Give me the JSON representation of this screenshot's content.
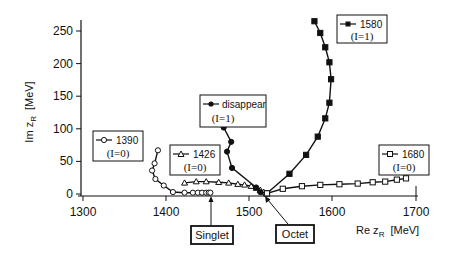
{
  "chart_data": {
    "type": "line",
    "title": "",
    "xlabel": "Re z_R [MeV]",
    "ylabel": "Im z_R [MeV]",
    "xlim": [
      1300,
      1700
    ],
    "ylim": [
      0,
      260
    ],
    "xticks": [
      1300,
      1400,
      1500,
      1600,
      1700
    ],
    "yticks": [
      0,
      50,
      100,
      150,
      200,
      250
    ],
    "grid": false,
    "legend_position": "inline boxes near each trajectory",
    "series": [
      {
        "name": "1390",
        "isospin": "(I=0)",
        "marker": "open-circle",
        "points": [
          [
            1390,
            67
          ],
          [
            1386,
            47
          ],
          [
            1383,
            36
          ],
          [
            1387,
            23
          ],
          [
            1397,
            13
          ],
          [
            1408,
            3
          ],
          [
            1422,
            2
          ],
          [
            1432,
            2
          ],
          [
            1438,
            2
          ],
          [
            1443,
            2
          ],
          [
            1448,
            2
          ],
          [
            1451,
            2
          ],
          [
            1453,
            2
          ]
        ]
      },
      {
        "name": "1426",
        "isospin": "(I=0)",
        "marker": "open-triangle",
        "points": [
          [
            1422,
            17
          ],
          [
            1436,
            19
          ],
          [
            1448,
            19
          ],
          [
            1463,
            18
          ],
          [
            1475,
            17
          ],
          [
            1486,
            15
          ],
          [
            1494,
            14
          ],
          [
            1502,
            12
          ],
          [
            1508,
            9
          ],
          [
            1513,
            6
          ],
          [
            1517,
            3
          ],
          [
            1520,
            1
          ]
        ]
      },
      {
        "name": "disappear",
        "isospin": "(I=1)",
        "marker": "filled-circle",
        "points": [
          [
            1469,
            102
          ],
          [
            1478,
            80
          ],
          [
            1473,
            65
          ],
          [
            1479,
            40
          ],
          [
            1508,
            10
          ],
          [
            1513,
            3
          ],
          [
            1521,
            1
          ]
        ]
      },
      {
        "name": "1580",
        "isospin": "(I=1)",
        "marker": "filled-square",
        "points": [
          [
            1578,
            265
          ],
          [
            1585,
            247
          ],
          [
            1591,
            225
          ],
          [
            1596,
            202
          ],
          [
            1598,
            176
          ],
          [
            1596,
            140
          ],
          [
            1591,
            116
          ],
          [
            1582,
            88
          ],
          [
            1568,
            60
          ],
          [
            1548,
            31
          ],
          [
            1521,
            1
          ]
        ]
      },
      {
        "name": "1680",
        "isospin": "(I=0)",
        "marker": "open-square",
        "points": [
          [
            1521,
            1
          ],
          [
            1540,
            8
          ],
          [
            1563,
            12
          ],
          [
            1585,
            14
          ],
          [
            1608,
            15
          ],
          [
            1630,
            16
          ],
          [
            1648,
            18
          ],
          [
            1663,
            19
          ],
          [
            1677,
            22
          ],
          [
            1688,
            24
          ]
        ]
      }
    ],
    "annotations": [
      {
        "text": "Singlet",
        "points_to": [
          1448,
          2
        ]
      },
      {
        "text": "Octet",
        "points_to": [
          1521,
          1
        ]
      }
    ]
  },
  "axes": {
    "x_title_main": "Re z",
    "x_title_sub": "R",
    "x_title_unit": "[MeV]",
    "y_title_main": "Im z",
    "y_title_sub": "R",
    "y_title_unit": "[MeV]",
    "x_tick_labels": [
      "1300",
      "1400",
      "1500",
      "1600",
      "1700"
    ],
    "y_tick_labels": [
      "0",
      "50",
      "100",
      "150",
      "200",
      "250"
    ]
  },
  "legends": {
    "l1390": {
      "name": "1390",
      "iso": "(I=0)"
    },
    "l1426": {
      "name": "1426",
      "iso": "(I=0)"
    },
    "ldisappear": {
      "name": "disappear",
      "iso": "(I=1)"
    },
    "l1580": {
      "name": "1580",
      "iso": "(I=1)"
    },
    "l1680": {
      "name": "1680",
      "iso": "(I=0)"
    }
  },
  "annotations": {
    "singlet": "Singlet",
    "octet": "Octet"
  }
}
